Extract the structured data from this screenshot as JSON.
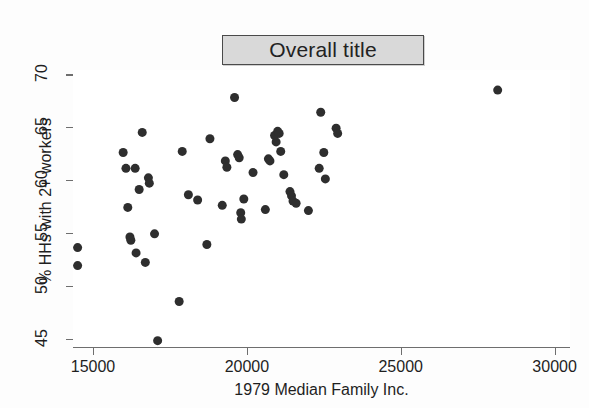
{
  "chart_data": {
    "type": "scatter",
    "title": "Overall title",
    "xlabel": "1979 Median Family Inc.",
    "ylabel": "% HHs with 2+ workers",
    "xlim": [
      14350,
      30500
    ],
    "ylim": [
      44.2,
      70.4
    ],
    "xticks": [
      15000,
      20000,
      25000,
      30000
    ],
    "xtick_labels": [
      "15000",
      "20000",
      "25000",
      "30000"
    ],
    "yticks": [
      45,
      50,
      55,
      60,
      65,
      70
    ],
    "ytick_labels": [
      "45",
      "50",
      "55",
      "60",
      "65",
      "70"
    ],
    "grid": false,
    "legend": null,
    "marker": {
      "shape": "circle",
      "color": "#2e2e2e",
      "size_px": 9
    },
    "series": [
      {
        "name": "states",
        "points": [
          [
            14500,
            53.6
          ],
          [
            14500,
            51.9
          ],
          [
            15980,
            62.6
          ],
          [
            16070,
            61.1
          ],
          [
            16130,
            57.4
          ],
          [
            16200,
            54.6
          ],
          [
            16230,
            54.3
          ],
          [
            16370,
            61.1
          ],
          [
            16400,
            53.1
          ],
          [
            16500,
            59.1
          ],
          [
            16600,
            64.5
          ],
          [
            16700,
            52.2
          ],
          [
            16800,
            60.2
          ],
          [
            16830,
            59.7
          ],
          [
            17000,
            54.9
          ],
          [
            17100,
            44.8
          ],
          [
            17800,
            48.5
          ],
          [
            17900,
            62.7
          ],
          [
            18100,
            58.6
          ],
          [
            18400,
            58.1
          ],
          [
            18700,
            53.9
          ],
          [
            18800,
            63.9
          ],
          [
            19200,
            57.6
          ],
          [
            19300,
            61.8
          ],
          [
            19350,
            61.2
          ],
          [
            19600,
            67.8
          ],
          [
            19700,
            62.4
          ],
          [
            19750,
            62.1
          ],
          [
            19800,
            56.9
          ],
          [
            19820,
            56.3
          ],
          [
            19900,
            58.2
          ],
          [
            20200,
            60.7
          ],
          [
            20600,
            57.2
          ],
          [
            20700,
            62.0
          ],
          [
            20750,
            61.8
          ],
          [
            20900,
            64.2
          ],
          [
            20950,
            63.6
          ],
          [
            21000,
            64.6
          ],
          [
            21050,
            64.4
          ],
          [
            21100,
            62.7
          ],
          [
            21200,
            60.5
          ],
          [
            21400,
            58.9
          ],
          [
            21450,
            58.5
          ],
          [
            21500,
            58.0
          ],
          [
            21600,
            57.8
          ],
          [
            22000,
            57.1
          ],
          [
            22350,
            61.1
          ],
          [
            22400,
            66.4
          ],
          [
            22500,
            62.6
          ],
          [
            22550,
            60.1
          ],
          [
            22900,
            64.9
          ],
          [
            22950,
            64.4
          ],
          [
            28150,
            68.5
          ]
        ]
      }
    ]
  }
}
